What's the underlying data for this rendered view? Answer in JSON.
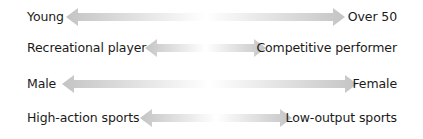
{
  "diagram": {
    "type": "bipolar-spectrum-arrows",
    "arrow_color": "#c4c4c4",
    "rows": [
      {
        "left": "Young",
        "right": "Over 50",
        "top": 5,
        "arrow_x1": 66,
        "arrow_x2": 345
      },
      {
        "left": "Recreational player",
        "right": "Competitive performer",
        "top": 36,
        "arrow_x1": 145,
        "arrow_x2": 266
      },
      {
        "left": "Male",
        "right": "Female",
        "top": 72,
        "arrow_x1": 62,
        "arrow_x2": 357
      },
      {
        "left": "High-action sports",
        "right": "Low-output sports",
        "top": 106,
        "arrow_x1": 140,
        "arrow_x2": 292
      }
    ]
  }
}
